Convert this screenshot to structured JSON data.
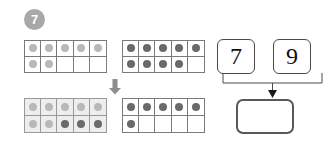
{
  "exercise": {
    "number": "7"
  },
  "ten_frames": {
    "top_left": {
      "label": "ten-frame-start-first-addend",
      "rows": [
        [
          "light",
          "light",
          "light",
          "light",
          "light"
        ],
        [
          "light",
          "light",
          "none",
          "none",
          "none"
        ]
      ],
      "count": "7",
      "shaded": false
    },
    "top_right": {
      "label": "ten-frame-start-second-addend",
      "rows": [
        [
          "dark",
          "dark",
          "dark",
          "dark",
          "dark"
        ],
        [
          "dark",
          "dark",
          "dark",
          "dark",
          "none"
        ]
      ],
      "count": "9",
      "shaded": false
    },
    "bottom_left": {
      "label": "ten-frame-result-filled",
      "rows": [
        [
          "light",
          "light",
          "light",
          "light",
          "light"
        ],
        [
          "light",
          "light",
          "dark",
          "dark",
          "dark"
        ]
      ],
      "count": "10",
      "shaded": true
    },
    "bottom_right": {
      "label": "ten-frame-result-remainder",
      "rows": [
        [
          "dark",
          "dark",
          "dark",
          "dark",
          "dark"
        ],
        [
          "dark",
          "none",
          "none",
          "none",
          "none"
        ]
      ],
      "count": "6",
      "shaded": false
    }
  },
  "arrows": {
    "transition": "down-arrow-icon",
    "connector": "bracket-down-arrow-icon"
  },
  "number_sentence": {
    "addend_1": "7",
    "addend_2": "9",
    "sum": ""
  },
  "colors": {
    "badge_bg": "#a8a8a8",
    "dot_light": "#b9b9b9",
    "dot_dark": "#6a6a6a",
    "frame_border": "#7a7a7a",
    "frame_shade": "#eeeeee",
    "card_border": "#4a4a4a",
    "answer_border": "#585858",
    "arrow": "#8e8e8e"
  }
}
